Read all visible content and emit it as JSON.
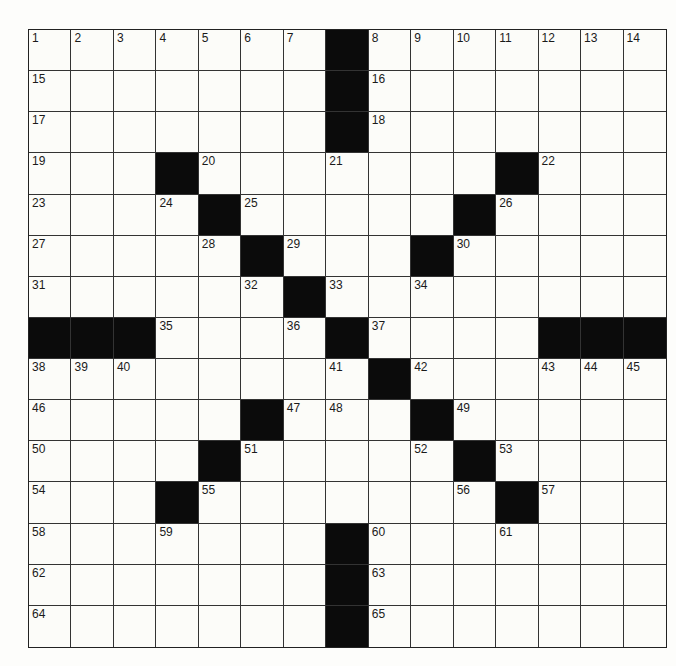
{
  "puzzle": {
    "rows": 15,
    "cols": 15,
    "colors": {
      "block": "#0b0b0b",
      "cell": "#fcfcf9",
      "line": "#333333"
    },
    "blocks": [
      [
        0,
        7
      ],
      [
        1,
        7
      ],
      [
        2,
        7
      ],
      [
        3,
        3
      ],
      [
        3,
        11
      ],
      [
        4,
        4
      ],
      [
        4,
        10
      ],
      [
        5,
        5
      ],
      [
        5,
        9
      ],
      [
        6,
        6
      ],
      [
        7,
        0
      ],
      [
        7,
        1
      ],
      [
        7,
        2
      ],
      [
        7,
        7
      ],
      [
        7,
        12
      ],
      [
        7,
        13
      ],
      [
        7,
        14
      ],
      [
        8,
        8
      ],
      [
        9,
        5
      ],
      [
        9,
        9
      ],
      [
        10,
        4
      ],
      [
        10,
        10
      ],
      [
        11,
        3
      ],
      [
        11,
        11
      ],
      [
        12,
        7
      ],
      [
        13,
        7
      ],
      [
        14,
        7
      ]
    ],
    "numbers": [
      {
        "r": 0,
        "c": 0,
        "n": "1"
      },
      {
        "r": 0,
        "c": 1,
        "n": "2"
      },
      {
        "r": 0,
        "c": 2,
        "n": "3"
      },
      {
        "r": 0,
        "c": 3,
        "n": "4"
      },
      {
        "r": 0,
        "c": 4,
        "n": "5"
      },
      {
        "r": 0,
        "c": 5,
        "n": "6"
      },
      {
        "r": 0,
        "c": 6,
        "n": "7"
      },
      {
        "r": 0,
        "c": 8,
        "n": "8"
      },
      {
        "r": 0,
        "c": 9,
        "n": "9"
      },
      {
        "r": 0,
        "c": 10,
        "n": "10"
      },
      {
        "r": 0,
        "c": 11,
        "n": "11"
      },
      {
        "r": 0,
        "c": 12,
        "n": "12"
      },
      {
        "r": 0,
        "c": 13,
        "n": "13"
      },
      {
        "r": 0,
        "c": 14,
        "n": "14"
      },
      {
        "r": 1,
        "c": 0,
        "n": "15"
      },
      {
        "r": 1,
        "c": 8,
        "n": "16"
      },
      {
        "r": 2,
        "c": 0,
        "n": "17"
      },
      {
        "r": 2,
        "c": 8,
        "n": "18"
      },
      {
        "r": 3,
        "c": 0,
        "n": "19"
      },
      {
        "r": 3,
        "c": 4,
        "n": "20"
      },
      {
        "r": 3,
        "c": 7,
        "n": "21"
      },
      {
        "r": 3,
        "c": 12,
        "n": "22"
      },
      {
        "r": 4,
        "c": 0,
        "n": "23"
      },
      {
        "r": 4,
        "c": 3,
        "n": "24"
      },
      {
        "r": 4,
        "c": 5,
        "n": "25"
      },
      {
        "r": 4,
        "c": 11,
        "n": "26"
      },
      {
        "r": 5,
        "c": 0,
        "n": "27"
      },
      {
        "r": 5,
        "c": 4,
        "n": "28"
      },
      {
        "r": 5,
        "c": 6,
        "n": "29"
      },
      {
        "r": 5,
        "c": 10,
        "n": "30"
      },
      {
        "r": 6,
        "c": 0,
        "n": "31"
      },
      {
        "r": 6,
        "c": 5,
        "n": "32"
      },
      {
        "r": 6,
        "c": 7,
        "n": "33"
      },
      {
        "r": 6,
        "c": 9,
        "n": "34"
      },
      {
        "r": 7,
        "c": 3,
        "n": "35"
      },
      {
        "r": 7,
        "c": 6,
        "n": "36"
      },
      {
        "r": 7,
        "c": 8,
        "n": "37"
      },
      {
        "r": 8,
        "c": 0,
        "n": "38"
      },
      {
        "r": 8,
        "c": 1,
        "n": "39"
      },
      {
        "r": 8,
        "c": 2,
        "n": "40"
      },
      {
        "r": 8,
        "c": 7,
        "n": "41"
      },
      {
        "r": 8,
        "c": 9,
        "n": "42"
      },
      {
        "r": 8,
        "c": 12,
        "n": "43"
      },
      {
        "r": 8,
        "c": 13,
        "n": "44"
      },
      {
        "r": 8,
        "c": 14,
        "n": "45"
      },
      {
        "r": 9,
        "c": 0,
        "n": "46"
      },
      {
        "r": 9,
        "c": 6,
        "n": "47"
      },
      {
        "r": 9,
        "c": 7,
        "n": "48"
      },
      {
        "r": 9,
        "c": 10,
        "n": "49"
      },
      {
        "r": 10,
        "c": 0,
        "n": "50"
      },
      {
        "r": 10,
        "c": 5,
        "n": "51"
      },
      {
        "r": 10,
        "c": 9,
        "n": "52"
      },
      {
        "r": 10,
        "c": 11,
        "n": "53"
      },
      {
        "r": 11,
        "c": 0,
        "n": "54"
      },
      {
        "r": 11,
        "c": 4,
        "n": "55"
      },
      {
        "r": 11,
        "c": 10,
        "n": "56"
      },
      {
        "r": 11,
        "c": 12,
        "n": "57"
      },
      {
        "r": 12,
        "c": 0,
        "n": "58"
      },
      {
        "r": 12,
        "c": 3,
        "n": "59"
      },
      {
        "r": 12,
        "c": 8,
        "n": "60"
      },
      {
        "r": 12,
        "c": 11,
        "n": "61"
      },
      {
        "r": 13,
        "c": 0,
        "n": "62"
      },
      {
        "r": 13,
        "c": 8,
        "n": "63"
      },
      {
        "r": 14,
        "c": 0,
        "n": "64"
      },
      {
        "r": 14,
        "c": 8,
        "n": "65"
      }
    ]
  }
}
